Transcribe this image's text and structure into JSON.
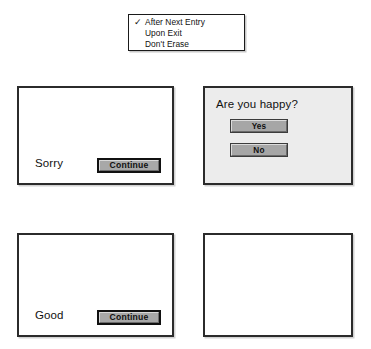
{
  "menu": {
    "name": "erase-timing-menu",
    "items": [
      {
        "label": "After Next Entry",
        "checked": true,
        "check_glyph": "✓"
      },
      {
        "label": "Upon Exit",
        "checked": false,
        "check_glyph": ""
      },
      {
        "label": "Don't Erase",
        "checked": false,
        "check_glyph": ""
      }
    ]
  },
  "panels": {
    "sorry": {
      "message": "Sorry",
      "button_label": "Continue"
    },
    "happy": {
      "question": "Are you happy?",
      "yes_label": "Yes",
      "no_label": "No"
    },
    "good": {
      "message": "Good",
      "button_label": "Continue"
    },
    "blank": {
      "content": ""
    }
  },
  "colors": {
    "page_background": "#ffffff",
    "panel_border": "#2b2b2b",
    "panel_fill": "#ffffff",
    "panel_fill_gray": "#ececec",
    "button_face": "#a8a8a8",
    "button_highlight": "#d9d9d9",
    "button_shadow": "#6d6d6d",
    "text": "#111111"
  }
}
